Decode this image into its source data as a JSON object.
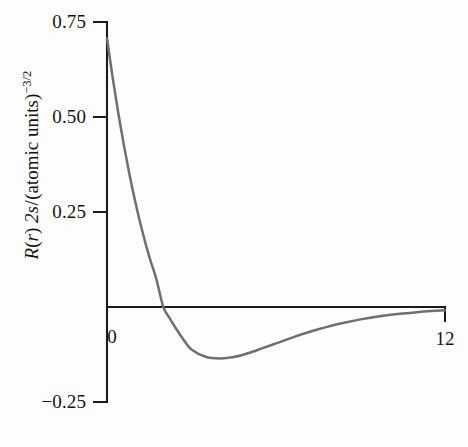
{
  "chart_data": {
    "type": "line",
    "title": "",
    "subtitle": "",
    "xlabel": "",
    "ylabel": "R(r) 2s/(atomic units)^-3/2",
    "ylabel_parts": {
      "r_symbol": "R",
      "paren_open": "(",
      "var_r": "r",
      "paren_close": ")",
      "orbital": "2s",
      "slash": "/",
      "units_open": "(atomic units)",
      "exponent": "−3/2"
    },
    "xlim": [
      0,
      12
    ],
    "ylim": [
      -0.25,
      0.75
    ],
    "grid": false,
    "legend": null,
    "x_ticks": [
      {
        "value": 0,
        "label": "0"
      },
      {
        "value": 12,
        "label": "12"
      }
    ],
    "y_ticks": [
      {
        "value": 0.75,
        "label": "0.75"
      },
      {
        "value": 0.5,
        "label": "0.50"
      },
      {
        "value": 0.25,
        "label": "0.25"
      },
      {
        "value": 0,
        "label": "0"
      },
      {
        "value": -0.25,
        "label": "−0.25"
      }
    ],
    "series": [
      {
        "name": "R(r) 2s",
        "color": "#6f6f6f",
        "x": [
          0,
          0.2,
          0.4,
          0.6,
          0.8,
          1.0,
          1.25,
          1.5,
          1.75,
          2.0,
          2.25,
          2.5,
          2.75,
          3.0,
          3.5,
          4.0,
          4.5,
          5.0,
          5.5,
          6.0,
          6.5,
          7.0,
          7.5,
          8.0,
          8.5,
          9.0,
          9.5,
          10.0,
          10.5,
          11.0,
          11.5,
          12.0
        ],
        "y": [
          0.7071,
          0.6043,
          0.5105,
          0.4254,
          0.3482,
          0.2785,
          0.2005,
          0.1327,
          0.0742,
          0.0,
          -0.0324,
          -0.0625,
          -0.0894,
          -0.1116,
          -0.131,
          -0.1353,
          -0.1318,
          -0.1217,
          -0.109,
          -0.0958,
          -0.0824,
          -0.0699,
          -0.0585,
          -0.0485,
          -0.0399,
          -0.0326,
          -0.0264,
          -0.0212,
          -0.017,
          -0.0135,
          -0.0107,
          -0.0084
        ]
      }
    ],
    "annotations": {
      "zero_crossing_x": 2.0,
      "minimum": {
        "x": 4.0,
        "y": -0.1353
      },
      "start": {
        "x": 0.0,
        "y": 0.7071
      }
    },
    "axis_color": "#1b1b1b",
    "curve_color": "#6f6f6f",
    "background": "#fdfdfd"
  }
}
